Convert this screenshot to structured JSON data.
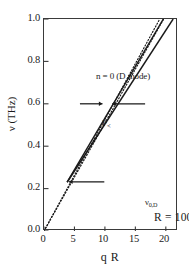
{
  "chart_data": {
    "type": "line",
    "title": "",
    "xlabel": "q R",
    "ylabel": "ν (THz)",
    "xlim": [
      0,
      22
    ],
    "ylim": [
      0.0,
      1.0
    ],
    "xticks": [
      0,
      5,
      10,
      15,
      20
    ],
    "xtick_labels": [
      "0",
      "5",
      "10",
      "15",
      "20"
    ],
    "yticks": [
      0.0,
      0.2,
      0.4,
      0.6,
      0.8,
      1.0
    ],
    "ytick_labels": [
      "0.0",
      "0.2",
      "0.4",
      "0.6",
      "0.8",
      "1.0"
    ],
    "grid": false,
    "legend": "none",
    "series": [
      {
        "name": "dispersion-dotted-lower",
        "style": "dotted",
        "x": [
          0.0,
          22.0
        ],
        "y": [
          0.0,
          1.12
        ]
      },
      {
        "name": "dispersion-solid-lower",
        "style": "solid",
        "x": [
          3.8,
          21.2
        ],
        "y": [
          0.23,
          1.0
        ]
      },
      {
        "name": "dispersion-solid-upper",
        "style": "solid",
        "x": [
          3.8,
          19.6
        ],
        "y": [
          0.23,
          1.0
        ]
      },
      {
        "name": "dispersion-dotted-upper",
        "style": "dotted",
        "x": [
          0.0,
          19.0
        ],
        "y": [
          0.0,
          1.0
        ]
      }
    ],
    "annotations": [
      {
        "name": "mode-label",
        "text": "n = 0 (D mode)",
        "x": 2.0,
        "y": 0.82
      },
      {
        "name": "radius-label",
        "text": "R = 100Å",
        "x": 12.5,
        "y": 0.18
      },
      {
        "name": "p-left-label",
        "text": "P",
        "sub": "<",
        "x": 5.2,
        "y": 0.6
      },
      {
        "name": "p-right-label",
        "text": "P",
        "sub": "i",
        "x": 17.0,
        "y": 0.6
      },
      {
        "name": "nu0d-label",
        "text": "ν",
        "sub": "0,D",
        "x": 10.2,
        "y": 0.255
      }
    ],
    "arrows": [
      {
        "name": "p-left-arrow",
        "x_start": 5.9,
        "x_end": 9.6,
        "y": 0.6,
        "head": "end"
      },
      {
        "name": "p-right-arrow",
        "x_start": 16.6,
        "x_end": 11.2,
        "y": 0.6,
        "head": "end"
      },
      {
        "name": "nu0d-arrow",
        "x_start": 9.9,
        "x_end": 4.1,
        "y": 0.232,
        "head": "end"
      }
    ]
  },
  "axes": {
    "y_title": "ν (THz)",
    "x_title": "q R",
    "y_tick_labels": [
      "1.0",
      "0.8",
      "0.6",
      "0.4",
      "0.2",
      "0.0"
    ],
    "x_tick_labels": [
      "0",
      "5",
      "10",
      "15",
      "20"
    ]
  },
  "annotations": {
    "mode": "n = 0 (D mode)",
    "radius": "R = 100Å",
    "p_left_base": "P",
    "p_left_sub": "<",
    "p_right_base": "P",
    "p_right_sub": "i",
    "nu0d_base": "ν",
    "nu0d_sub": "0,D"
  },
  "colors": {
    "axis": "#3a3a3a",
    "line": "#1a1a1a",
    "background": "#ffffff"
  }
}
